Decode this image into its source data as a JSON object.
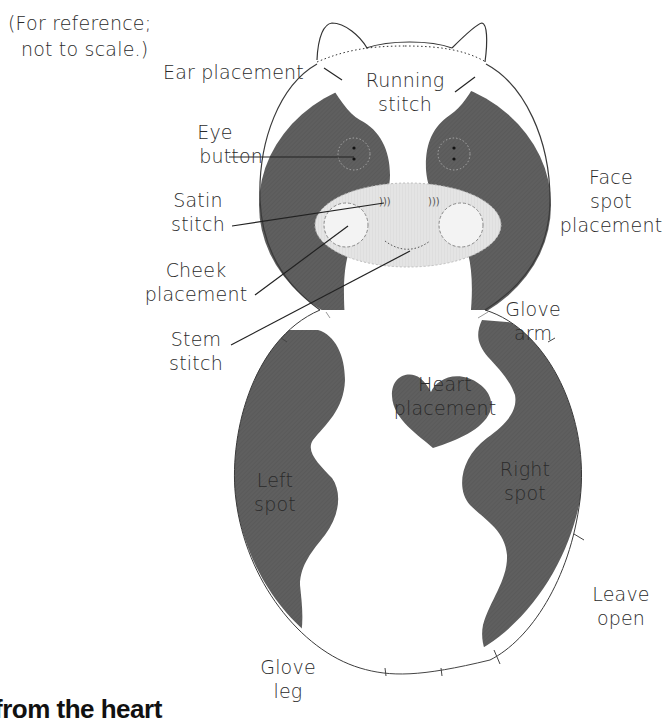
{
  "diagram": {
    "note": "(For reference;\nnot to scale.)",
    "note_line1": "(For reference;",
    "note_line2": "not to scale.)",
    "colors": {
      "spot_fill": "#5e5e5e",
      "face_fill": "#e6e6e6",
      "outline": "#3a3a3a",
      "body_fill": "#ffffff",
      "text": "#2b2b2b"
    },
    "labels": {
      "ear_placement": "Ear placement",
      "running_stitch": [
        "Running",
        "stitch"
      ],
      "eye_button": [
        "Eye",
        "button"
      ],
      "satin_stitch": [
        "Satin",
        "stitch"
      ],
      "cheek_placement": [
        "Cheek",
        "placement"
      ],
      "stem_stitch": [
        "Stem",
        "stitch"
      ],
      "face_spot_placement": [
        "Face",
        "spot",
        "placement"
      ],
      "glove_arm": [
        "Glove",
        "arm"
      ],
      "heart_placement": [
        "Heart",
        "placement"
      ],
      "left_spot": [
        "Left",
        "spot"
      ],
      "right_spot": [
        "Right",
        "spot"
      ],
      "leave_open": [
        "Leave",
        "open"
      ],
      "glove_leg": [
        "Glove",
        "leg"
      ]
    }
  },
  "footer": {
    "heading_partial": "from the heart"
  }
}
